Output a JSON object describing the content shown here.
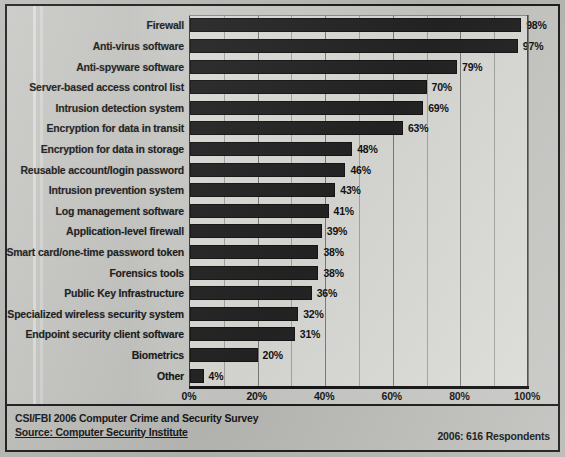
{
  "chart_data": {
    "type": "bar",
    "orientation": "horizontal",
    "title": "",
    "xlabel": "",
    "ylabel": "",
    "xlim": [
      0,
      100
    ],
    "xticks": [
      "0%",
      "20%",
      "40%",
      "60%",
      "80%",
      "100%"
    ],
    "xtick_values": [
      0,
      20,
      40,
      60,
      80,
      100
    ],
    "grid": true,
    "grid_minor_step": 10,
    "legend": "none",
    "value_suffix": "%",
    "categories": [
      "Firewall",
      "Anti-virus software",
      "Anti-spyware software",
      "Server-based access control list",
      "Intrusion detection system",
      "Encryption for data in transit",
      "Encryption for data in storage",
      "Reusable account/login password",
      "Intrusion prevention system",
      "Log management software",
      "Application-level firewall",
      "Smart card/one-time password token",
      "Forensics tools",
      "Public Key Infrastructure",
      "Specialized wireless security system",
      "Endpoint security client software",
      "Biometrics",
      "Other"
    ],
    "values": [
      98,
      97,
      79,
      70,
      69,
      63,
      48,
      46,
      43,
      41,
      39,
      38,
      38,
      36,
      32,
      31,
      20,
      4
    ],
    "value_labels": [
      "98%",
      "97%",
      "79%",
      "70%",
      "69%",
      "63%",
      "48%",
      "46%",
      "43%",
      "41%",
      "39%",
      "38%",
      "38%",
      "36%",
      "32%",
      "31%",
      "20%",
      "4%"
    ],
    "bar_color": "#242424"
  },
  "footer": {
    "line1": "CSI/FBI 2006 Computer Crime and Security Survey",
    "line2": "Source: Computer Security Institute",
    "right": "2006: 616 Respondents"
  }
}
